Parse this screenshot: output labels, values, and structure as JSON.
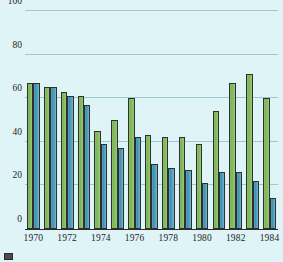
{
  "chart_data": {
    "type": "bar",
    "title": "",
    "xlabel": "",
    "ylabel": "",
    "ylim": [
      0,
      100
    ],
    "yticks": [
      0,
      20,
      40,
      60,
      80,
      100
    ],
    "ytick_labels": [
      "0",
      "20",
      "40",
      "60",
      "80",
      "100"
    ],
    "grid": true,
    "legend_position": "bottom-left",
    "categories": [
      1970,
      1971,
      1972,
      1973,
      1974,
      1975,
      1976,
      1977,
      1978,
      1979,
      1980,
      1981,
      1982,
      1983,
      1984
    ],
    "xtick_labels": [
      "1970",
      "1972",
      "1974",
      "1976",
      "1978",
      "1980",
      "1982",
      "1984"
    ],
    "xtick_categories": [
      1970,
      1972,
      1974,
      1976,
      1978,
      1980,
      1982,
      1984
    ],
    "series": [
      {
        "name": "green-series",
        "color": "#7cb556",
        "values": [
          67,
          65,
          63,
          61,
          45,
          50,
          60,
          43,
          42,
          42,
          39,
          54,
          67,
          71,
          60
        ]
      },
      {
        "name": "blue-series",
        "color": "#3e90b2",
        "values": [
          67,
          65,
          61,
          57,
          39,
          37,
          42,
          30,
          28,
          27,
          21,
          26,
          26,
          22,
          14
        ]
      }
    ]
  },
  "colors": {
    "background": "#dff4f7",
    "gridline": "#9fc8d6",
    "axis": "#2b2b2b",
    "green": "#7cb556",
    "blue": "#3e90b2",
    "text": "#242424"
  },
  "legend": {
    "items": [
      {
        "label": "",
        "swatch": "#4c4c4c"
      }
    ]
  }
}
